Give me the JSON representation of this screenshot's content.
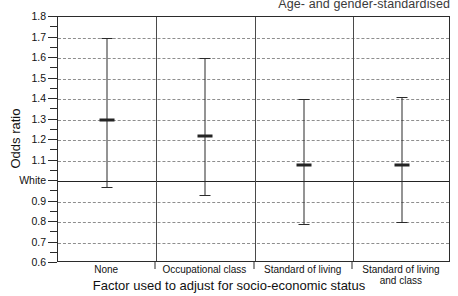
{
  "chart_data": {
    "type": "scatter",
    "title": "Age- and gender-standardised",
    "xlabel": "Factor used to adjust for socio-economic status",
    "ylabel": "Odds ratio",
    "ylim": [
      0.6,
      1.8
    ],
    "ytick_labels": [
      "1.8",
      "1.7",
      "1.6",
      "1.5",
      "1.4",
      "1.3",
      "1.2",
      "1.1",
      "White",
      "0.9",
      "0.8",
      "0.7",
      "0.6"
    ],
    "ytick_values": [
      1.8,
      1.7,
      1.6,
      1.5,
      1.4,
      1.3,
      1.2,
      1.1,
      1.0,
      0.9,
      0.8,
      0.7,
      0.6
    ],
    "minor_tick_values": [
      1.75,
      1.65,
      1.55,
      1.45,
      1.35,
      1.25,
      1.15,
      1.05,
      0.95,
      0.85,
      0.75,
      0.65
    ],
    "grid": true,
    "grid_style": "dashed",
    "reference_line": {
      "value": 1.0,
      "label": "White"
    },
    "categories": [
      "None",
      "Occupational class",
      "Standard of living",
      "Standard of living\nand class"
    ],
    "category_lines": [
      "None",
      "Occupational class",
      "Standard of living",
      "Standard of living|and class"
    ],
    "values": [
      1.3,
      1.22,
      1.08,
      1.08
    ],
    "ci_lower": [
      0.97,
      0.93,
      0.79,
      0.8
    ],
    "ci_upper": [
      1.7,
      1.6,
      1.4,
      1.41
    ],
    "legend": null,
    "colors": {
      "marker": "#242424",
      "error_bar": "#2b2b2b",
      "grid": "#8e8e8e",
      "reference": "#232323",
      "frame": "#2b2b2b",
      "background": "#ffffff"
    }
  }
}
